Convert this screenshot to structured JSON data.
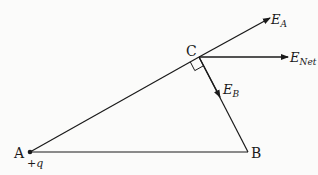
{
  "diagram": {
    "points": {
      "A": {
        "label": "A",
        "charge_label": "+q"
      },
      "B": {
        "label": "B"
      },
      "C": {
        "label": "C"
      }
    },
    "vectors": [
      {
        "id": "EA",
        "main": "E",
        "sub": "A"
      },
      {
        "id": "ENet",
        "main": "E",
        "sub": "Net"
      },
      {
        "id": "EB",
        "main": "E",
        "sub": "B"
      }
    ],
    "right_angle_at": "C",
    "colors": {
      "line": "#1a1a1a",
      "background": "#fbfbfa"
    }
  }
}
